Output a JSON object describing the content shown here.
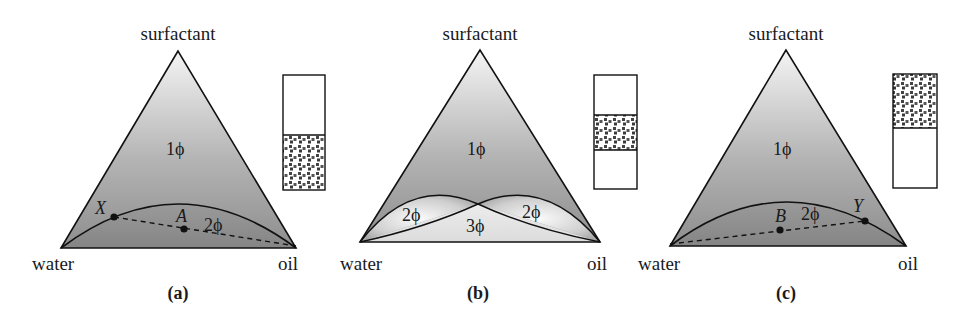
{
  "figure": {
    "vertex_labels": {
      "top": "surfactant",
      "left": "water",
      "right": "oil"
    },
    "panels": [
      {
        "id": "a",
        "caption": "(a)",
        "one_phase_label": "1ϕ",
        "two_phase_label": "2ϕ",
        "points": [
          {
            "name": "X",
            "role": "phase-boundary point"
          },
          {
            "name": "A",
            "role": "overall composition"
          }
        ],
        "tie_line": "X – A – oil corner",
        "test_tube": {
          "top": "clear",
          "bottom": "dotted (microemulsion)"
        }
      },
      {
        "id": "b",
        "caption": "(b)",
        "one_phase_label": "1ϕ",
        "two_phase_left_label": "2ϕ",
        "two_phase_right_label": "2ϕ",
        "three_phase_label": "3ϕ",
        "test_tube": {
          "top": "clear",
          "middle": "dotted (microemulsion)",
          "bottom": "clear"
        }
      },
      {
        "id": "c",
        "caption": "(c)",
        "one_phase_label": "1ϕ",
        "two_phase_label": "2ϕ",
        "points": [
          {
            "name": "B",
            "role": "overall composition"
          },
          {
            "name": "Y",
            "role": "phase-boundary point"
          }
        ],
        "tie_line": "water corner – B – Y",
        "test_tube": {
          "top": "dotted (microemulsion)",
          "bottom": "clear"
        }
      }
    ],
    "colors": {
      "triangle_top": "#f2f2f2",
      "triangle_bottom": "#8c8c8c",
      "two_phase_dark": "#8a8a8a",
      "three_phase_light": "#e6e6e6",
      "line": "#111111"
    }
  }
}
